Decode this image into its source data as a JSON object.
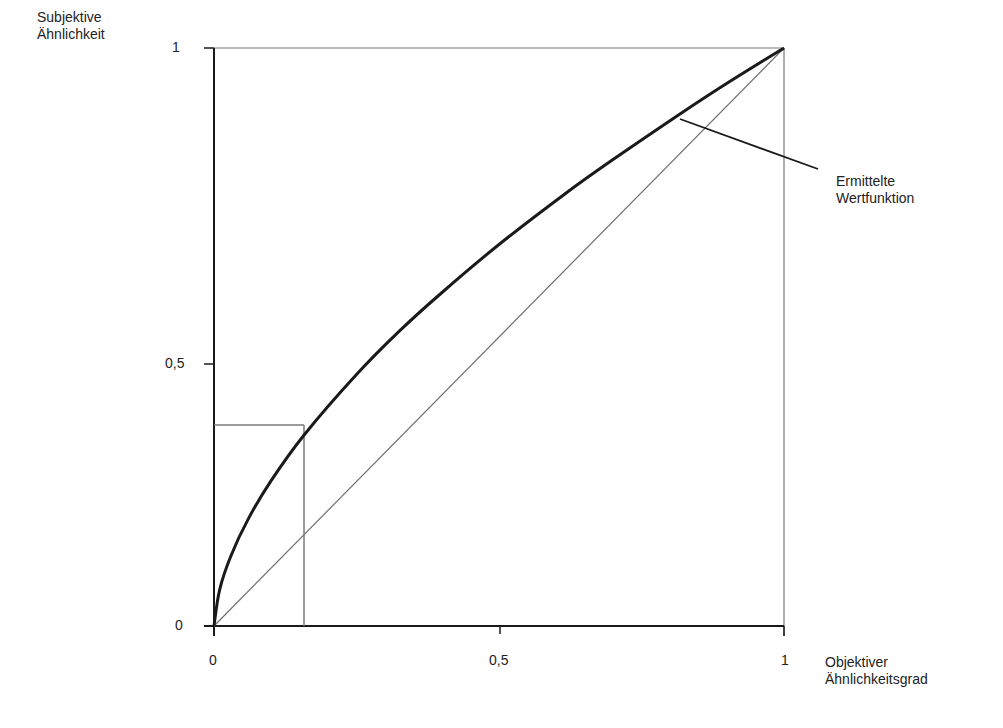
{
  "chart_data": {
    "type": "line",
    "title": "",
    "ylabel": "Subjektive Ähnlichkeit",
    "ylabel_lines": [
      "Subjektive",
      "Ähnlichkeit"
    ],
    "xlabel": "Objektiver Ähnlichkeitsgrad",
    "xlabel_lines": [
      "Objektiver",
      "Ähnlichkeitsgrad"
    ],
    "xlim": [
      0,
      1
    ],
    "ylim": [
      0,
      1
    ],
    "xticks": [
      0,
      0.5,
      1
    ],
    "xtick_labels": [
      "0",
      "0,5",
      "1"
    ],
    "yticks": [
      0,
      0.5,
      1
    ],
    "ytick_labels": [
      "0",
      "0,5",
      "1"
    ],
    "grid": false,
    "series": [
      {
        "name": "Ermittelte Wertfunktion",
        "style": "thick-dark",
        "x": [
          0,
          0.01,
          0.03,
          0.06,
          0.1,
          0.157,
          0.25,
          0.325,
          0.4,
          0.5,
          0.615,
          0.7,
          0.815,
          0.9,
          1.0
        ],
        "y": [
          0,
          0.063,
          0.122,
          0.185,
          0.251,
          0.329,
          0.435,
          0.51,
          0.577,
          0.66,
          0.747,
          0.807,
          0.884,
          0.939,
          1.0
        ]
      },
      {
        "name": "Diagonale (y = x)",
        "style": "thin-gray",
        "x": [
          0,
          1
        ],
        "y": [
          0,
          1
        ]
      }
    ],
    "reference_lines": [
      {
        "type": "vertical",
        "x": 0.157,
        "y_from": 0,
        "y_to": 0.348
      },
      {
        "type": "horizontal",
        "y": 0.348,
        "x_from": 0,
        "x_to": 0.157
      }
    ],
    "annotations": [
      {
        "text": "Ermittelte Wertfunktion",
        "text_lines": [
          "Ermittelte",
          "Wertfunktion"
        ],
        "points_to": {
          "x": 0.815,
          "y": 0.884
        }
      }
    ]
  },
  "labels": {
    "ylabel_line1": "Subjektive",
    "ylabel_line2": "Ähnlichkeit",
    "xlabel_line1": "Objektiver",
    "xlabel_line2": "Ähnlichkeitsgrad",
    "ytick_1": "1",
    "ytick_05": "0,5",
    "ytick_0": "0",
    "xtick_0": "0",
    "xtick_05": "0,5",
    "xtick_1": "1",
    "annotation_line1": "Ermittelte",
    "annotation_line2": "Wertfunktion"
  },
  "colors": {
    "axis": "#1a1a1a",
    "curve": "#1a1a1a",
    "thin": "#777777",
    "text": "#222222"
  }
}
